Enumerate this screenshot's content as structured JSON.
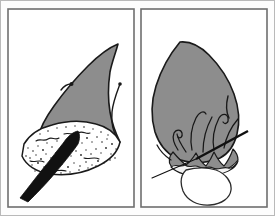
{
  "figure": {
    "panel_count": 2,
    "background_color": "#fdfdfd",
    "frame_color": "#6f6f6f",
    "tissue_color": "#8d8d8d",
    "outline_color": "#1a1a1a",
    "instrument_color": "#111111",
    "bone_field_color": "#ffffff"
  },
  "panels": [
    {
      "id": "panel-left",
      "label": "",
      "caption": "",
      "frame": {
        "x": 8,
        "y": 9,
        "width": 126,
        "height": 198
      },
      "elements": [
        {
          "name": "tissue-flap",
          "type": "shape",
          "fill": "#8d8d8d",
          "description": "raised pointed soft-tissue flap"
        },
        {
          "name": "flap-apex-notch",
          "type": "line",
          "description": "small notch mark at left of apex"
        },
        {
          "name": "flap-right-crease",
          "type": "line",
          "description": "curved crease along right flank"
        },
        {
          "name": "stippled-bone-field",
          "type": "texture",
          "fill": "#ffffff",
          "description": "stippled exposed bone surface"
        },
        {
          "name": "elevator-instrument",
          "type": "shape",
          "fill": "#111111",
          "description": "dark periosteal elevator with angled tip"
        }
      ]
    },
    {
      "id": "panel-right",
      "label": "",
      "caption": "",
      "frame": {
        "x": 141,
        "y": 9,
        "width": 126,
        "height": 198
      },
      "elements": [
        {
          "name": "tissue-flap",
          "type": "shape",
          "fill": "#8d8d8d",
          "description": "repositioned soft-tissue flap"
        },
        {
          "name": "flap-right-crease",
          "type": "line",
          "description": "short crease on upper right margin"
        },
        {
          "name": "suture-loops",
          "type": "lines",
          "count": 6,
          "description": "curved interrupted suture threads"
        },
        {
          "name": "scalloped-margin",
          "type": "shape",
          "description": "ruffled sutured tissue margin"
        },
        {
          "name": "suture-needle",
          "type": "line",
          "description": "straight needle crossing the margin diagonally"
        },
        {
          "name": "needle-thread-tail",
          "type": "line",
          "description": "thread tail trailing to the lower left"
        },
        {
          "name": "exposed-crown",
          "type": "shape",
          "fill": "#ffffff",
          "description": "white rounded crown beneath margin"
        }
      ]
    }
  ]
}
